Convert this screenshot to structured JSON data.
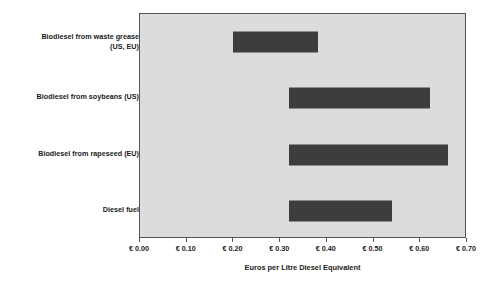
{
  "chart_data": {
    "type": "bar",
    "orientation": "horizontal",
    "subtype": "range-bar",
    "title": "",
    "xlabel": "Euros per Litre Diesel Equivalent",
    "ylabel": "",
    "xlim": [
      0.0,
      0.7
    ],
    "grid": false,
    "legend": null,
    "categories": [
      "Biodiesel from waste grease\n(US, EU)",
      "Biodiesel from soybeans (US)",
      "Biodiesel from rapeseed (EU)",
      "Diesel fuel"
    ],
    "bars": [
      {
        "category": "Biodiesel from waste grease (US, EU)",
        "low": 0.2,
        "high": 0.38
      },
      {
        "category": "Biodiesel from soybeans (US)",
        "low": 0.32,
        "high": 0.62
      },
      {
        "category": "Biodiesel from rapeseed (EU)",
        "low": 0.32,
        "high": 0.66
      },
      {
        "category": "Diesel fuel",
        "low": 0.32,
        "high": 0.54
      }
    ],
    "xticks": [
      0.0,
      0.1,
      0.2,
      0.3,
      0.4,
      0.5,
      0.6,
      0.7
    ],
    "xtick_labels": [
      "€ 0.00",
      "€ 0.10",
      "€ 0.20",
      "€ 0.30",
      "€ 0.40",
      "€ 0.50",
      "€ 0.60",
      "€ 0.70"
    ],
    "colors": {
      "bar": "#3d3d3d",
      "plot_background": "#dcdcdc",
      "figure_background": "#ffffff",
      "axis": "#555555",
      "text": "#1a1a1a"
    }
  }
}
